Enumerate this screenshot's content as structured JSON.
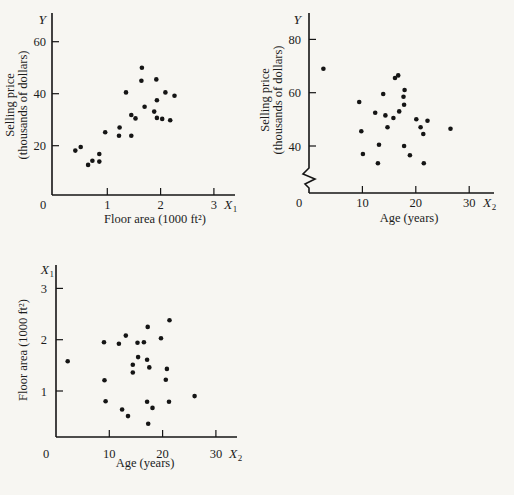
{
  "page": {
    "background": "#f7f6f2",
    "ink": "#151515"
  },
  "chart_data": [
    {
      "id": "price-vs-floor-area",
      "type": "scatter",
      "x_axis": {
        "var": "X",
        "var_sub": "1",
        "label": "Floor area (1000 ft²)",
        "ticks": [
          1,
          2,
          3
        ],
        "origin_label": "0",
        "range": [
          0,
          3.4
        ]
      },
      "y_axis": {
        "var": "Y",
        "var_sub": "",
        "label_lines": [
          "Selling price",
          "(thousands of dollars)"
        ],
        "ticks": [
          20,
          40,
          60
        ],
        "range": [
          8,
          66
        ],
        "axis_break": false
      },
      "points": [
        [
          0.4,
          18.1
        ],
        [
          0.5,
          19.5
        ],
        [
          0.64,
          12.6
        ],
        [
          0.72,
          14.2
        ],
        [
          0.85,
          13.9
        ],
        [
          0.85,
          16.8
        ],
        [
          0.96,
          25.2
        ],
        [
          1.22,
          23.8
        ],
        [
          1.23,
          27.0
        ],
        [
          1.35,
          40.5
        ],
        [
          1.45,
          23.8
        ],
        [
          1.45,
          31.8
        ],
        [
          1.53,
          30.5
        ],
        [
          1.64,
          45.0
        ],
        [
          1.65,
          50.0
        ],
        [
          1.7,
          35.0
        ],
        [
          1.88,
          33.1
        ],
        [
          1.92,
          45.5
        ],
        [
          1.93,
          37.5
        ],
        [
          1.93,
          30.7
        ],
        [
          2.03,
          30.3
        ],
        [
          2.09,
          40.5
        ],
        [
          2.18,
          29.8
        ],
        [
          2.26,
          39.2
        ]
      ]
    },
    {
      "id": "price-vs-age",
      "type": "scatter",
      "x_axis": {
        "var": "X",
        "var_sub": "2",
        "label": "Age (years)",
        "ticks": [
          10,
          20,
          30
        ],
        "origin_label": "0",
        "range": [
          0,
          34
        ]
      },
      "y_axis": {
        "var": "Y",
        "var_sub": "",
        "label_lines": [
          "Selling price",
          "(thousands of dollars)"
        ],
        "ticks": [
          40,
          60,
          80
        ],
        "range": [
          30,
          90
        ],
        "axis_break": true
      },
      "points": [
        [
          2.7,
          69
        ],
        [
          9.4,
          56.5
        ],
        [
          9.8,
          45.5
        ],
        [
          10.1,
          37
        ],
        [
          12.4,
          52.5
        ],
        [
          12.9,
          33.5
        ],
        [
          13.1,
          40.5
        ],
        [
          13.9,
          59.5
        ],
        [
          14.3,
          51.5
        ],
        [
          14.7,
          47
        ],
        [
          15.8,
          50.5
        ],
        [
          16.1,
          65.5
        ],
        [
          16.7,
          66.5
        ],
        [
          16.9,
          53
        ],
        [
          17.7,
          58.5
        ],
        [
          17.8,
          55.5
        ],
        [
          17.8,
          40
        ],
        [
          17.9,
          61
        ],
        [
          18.9,
          36.5
        ],
        [
          20.1,
          50
        ],
        [
          20.9,
          47
        ],
        [
          21.4,
          44.5
        ],
        [
          21.5,
          33.5
        ],
        [
          22.2,
          49.5
        ],
        [
          26.5,
          46.5
        ]
      ]
    },
    {
      "id": "floor-area-vs-age",
      "type": "scatter",
      "x_axis": {
        "var": "X",
        "var_sub": "2",
        "label": "Age (years)",
        "ticks": [
          10,
          20,
          30
        ],
        "origin_label": "0",
        "range": [
          0,
          34
        ]
      },
      "y_axis": {
        "var": "X",
        "var_sub": "1",
        "label_lines": [
          "Floor area (1000 ft²)"
        ],
        "ticks": [
          1,
          2,
          3
        ],
        "range": [
          0.2,
          3.4
        ],
        "axis_break": false
      },
      "points": [
        [
          2.2,
          1.58
        ],
        [
          9.0,
          1.95
        ],
        [
          9.1,
          1.21
        ],
        [
          9.3,
          0.8
        ],
        [
          11.8,
          1.92
        ],
        [
          12.4,
          0.64
        ],
        [
          13.1,
          2.08
        ],
        [
          13.5,
          0.51
        ],
        [
          14.4,
          1.51
        ],
        [
          14.4,
          1.36
        ],
        [
          15.3,
          1.94
        ],
        [
          15.4,
          1.66
        ],
        [
          16.5,
          1.95
        ],
        [
          17.1,
          1.61
        ],
        [
          17.1,
          0.79
        ],
        [
          17.2,
          2.25
        ],
        [
          17.3,
          0.36
        ],
        [
          17.5,
          1.46
        ],
        [
          18.1,
          0.67
        ],
        [
          19.7,
          2.03
        ],
        [
          20.6,
          1.22
        ],
        [
          20.8,
          1.43
        ],
        [
          21.2,
          0.79
        ],
        [
          21.3,
          2.38
        ],
        [
          26.0,
          0.9
        ]
      ]
    }
  ]
}
